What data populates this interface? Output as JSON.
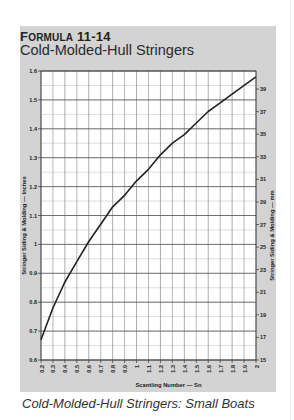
{
  "header": {
    "formula_label": "Formula 11-14",
    "formula_label_first": "F",
    "formula_label_rest": "ORMULA",
    "formula_number": "11-14",
    "title": "Cold-Molded-Hull Stringers"
  },
  "caption": "Cold-Molded-Hull Stringers: Small Boats",
  "colors": {
    "panel": "#d3d3d3",
    "plot_bg": "#ffffff",
    "major_grid": "#555555",
    "minor_grid": "#c8c8c8",
    "curve": "#222222"
  },
  "chart_data": {
    "type": "line",
    "title": "Cold-Molded-Hull Stringers",
    "xlabel": "Scantling Number — Sn",
    "ylabel": "Stringer Siding & Molding — Inches",
    "y2label": "Stringer Siding & Molding — mm",
    "xlim": [
      0.2,
      2.0
    ],
    "ylim": [
      0.6,
      1.6
    ],
    "y2lim": [
      15,
      40.6
    ],
    "grid": true,
    "legend": "none",
    "x_ticks": [
      "0.2",
      "0.3",
      "0.4",
      "0.5",
      "0.6",
      "0.7",
      "0.8",
      "0.9",
      "1",
      "1.1",
      "1.2",
      "1.3",
      "1.4",
      "1.5",
      "1.6",
      "1.7",
      "1.8",
      "1.9",
      "2"
    ],
    "y_ticks": [
      "0.6",
      "0.7",
      "0.8",
      "0.9",
      "1",
      "1.1",
      "1.2",
      "1.3",
      "1.4",
      "1.5",
      "1.6"
    ],
    "y2_ticks": [
      "15",
      "17",
      "19",
      "21",
      "23",
      "25",
      "27",
      "29",
      "31",
      "33",
      "35",
      "37",
      "39"
    ],
    "series": [
      {
        "name": "Stringer Siding & Molding",
        "x": [
          0.2,
          0.3,
          0.4,
          0.5,
          0.6,
          0.7,
          0.8,
          0.9,
          1.0,
          1.1,
          1.2,
          1.3,
          1.4,
          1.5,
          1.6,
          1.7,
          1.8,
          1.9,
          2.0
        ],
        "values": [
          0.67,
          0.78,
          0.87,
          0.94,
          1.01,
          1.07,
          1.13,
          1.17,
          1.22,
          1.26,
          1.31,
          1.35,
          1.38,
          1.42,
          1.46,
          1.49,
          1.52,
          1.55,
          1.58
        ]
      }
    ]
  }
}
